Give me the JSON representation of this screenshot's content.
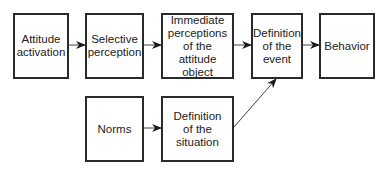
{
  "diagram": {
    "nodes": [
      {
        "id": "attitude-activation",
        "label": "Attitude\nactivation"
      },
      {
        "id": "selective-perception",
        "label": "Selective\nperception"
      },
      {
        "id": "immediate-perceptions",
        "label": "Immediate\nperceptions\nof the attitude\nobject"
      },
      {
        "id": "definition-event",
        "label": "Definition\nof the\nevent"
      },
      {
        "id": "behavior",
        "label": "Behavior"
      },
      {
        "id": "norms",
        "label": "Norms"
      },
      {
        "id": "definition-situation",
        "label": "Definition\nof the\nsituation"
      }
    ],
    "edges": [
      {
        "from": "attitude-activation",
        "to": "selective-perception"
      },
      {
        "from": "selective-perception",
        "to": "immediate-perceptions"
      },
      {
        "from": "immediate-perceptions",
        "to": "definition-event"
      },
      {
        "from": "definition-event",
        "to": "behavior"
      },
      {
        "from": "norms",
        "to": "definition-situation"
      },
      {
        "from": "definition-situation",
        "to": "definition-event"
      }
    ],
    "colors": {
      "stroke": "#2a2a2a",
      "background": "#ffffff",
      "text": "#222222"
    }
  }
}
